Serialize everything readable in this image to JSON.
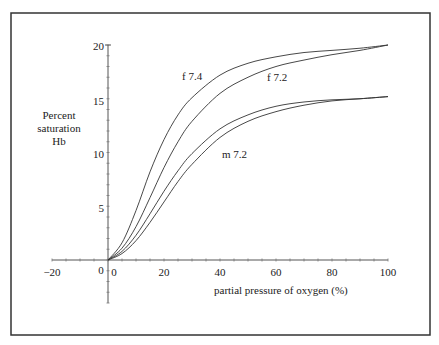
{
  "chart_data": {
    "type": "line",
    "title": "",
    "xlabel": "partial pressure of oxygen (%)",
    "ylabel": "Percent saturation Hb",
    "ylabel_lines": [
      "Percent",
      "saturation",
      "Hb"
    ],
    "xlim": [
      -20,
      100
    ],
    "ylim": [
      -5,
      20
    ],
    "x_ticks": [
      "-20",
      "0",
      "20",
      "40",
      "60",
      "80",
      "100"
    ],
    "y_ticks": [
      "5",
      "10",
      "15",
      "20"
    ],
    "origin_label": "0",
    "grid": false,
    "series": [
      {
        "name": "f 7.4",
        "x": [
          0,
          5,
          10,
          15,
          20,
          25,
          30,
          40,
          50,
          60,
          70,
          80,
          90,
          100
        ],
        "y": [
          0,
          1.6,
          4.6,
          8.2,
          11.2,
          13.5,
          15.1,
          17.2,
          18.3,
          18.9,
          19.3,
          19.5,
          19.7,
          20
        ]
      },
      {
        "name": "f 7.2",
        "x": [
          0,
          5,
          10,
          15,
          20,
          25,
          30,
          40,
          50,
          60,
          70,
          80,
          90,
          100
        ],
        "y": [
          0,
          1.1,
          3.1,
          5.8,
          8.6,
          11.0,
          12.9,
          15.5,
          17.0,
          18.0,
          18.6,
          19.1,
          19.5,
          20
        ]
      },
      {
        "name": "m 7.4",
        "x": [
          0,
          5,
          10,
          15,
          20,
          25,
          30,
          40,
          50,
          60,
          70,
          80,
          90,
          100
        ],
        "y": [
          0,
          0.8,
          2.3,
          4.3,
          6.4,
          8.3,
          9.9,
          12.2,
          13.5,
          14.3,
          14.7,
          14.9,
          15.0,
          15.2
        ]
      },
      {
        "name": "m 7.2",
        "x": [
          0,
          5,
          10,
          15,
          20,
          25,
          30,
          40,
          50,
          60,
          70,
          80,
          90,
          100
        ],
        "y": [
          0,
          0.6,
          1.8,
          3.5,
          5.4,
          7.3,
          8.9,
          11.4,
          12.9,
          13.8,
          14.4,
          14.8,
          15.0,
          15.2
        ]
      }
    ],
    "annotations": [
      {
        "text": "f 7.4",
        "x": 20,
        "y": 17.5
      },
      {
        "text": "f 7.2",
        "x": 58,
        "y": 16.2
      },
      {
        "text": "m 7.2",
        "x": 38,
        "y": 10.3
      }
    ]
  },
  "labels": {
    "ylabel_1": "Percent",
    "ylabel_2": "saturation",
    "ylabel_3": "Hb",
    "xlabel": "partial pressure of oxygen (%)",
    "origin": "0",
    "xt_m20": "−20",
    "xt_0": "0",
    "xt_20": "20",
    "xt_40": "40",
    "xt_60": "60",
    "xt_80": "80",
    "xt_100": "100",
    "yt_5": "5",
    "yt_10": "10",
    "yt_15": "15",
    "yt_20": "20",
    "ann_f74": "f 7.4",
    "ann_f72": "f 7.2",
    "ann_m72": "m 7.2"
  }
}
